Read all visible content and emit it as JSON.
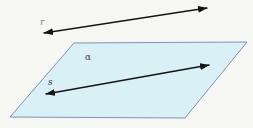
{
  "background": "#f6f6f3",
  "arrow_color": "#141414",
  "plane": {
    "label": "α",
    "points": "74,43 247,42 185,118 10,117",
    "fill": "#d9f0f7",
    "stroke": "#8191b6",
    "label_x": 85,
    "label_y": 60,
    "label_color": "#3f3f3f"
  },
  "line_r": {
    "label": "r",
    "x1": 44,
    "y1": 33,
    "x2": 207,
    "y2": 8,
    "color": "#141414",
    "label_x": 40,
    "label_y": 25,
    "label_color": "#7d7d7d"
  },
  "line_s": {
    "label": "s",
    "x1": 46,
    "y1": 94,
    "x2": 209,
    "y2": 65,
    "color": "#141414",
    "label_x": 48,
    "label_y": 85,
    "label_color": "#2b2b2b"
  }
}
